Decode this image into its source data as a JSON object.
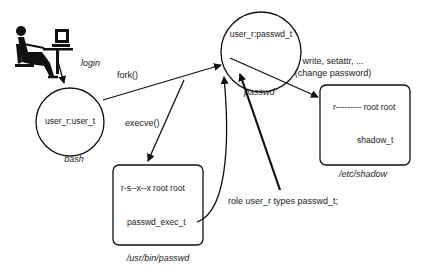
{
  "nodes": {
    "user": {
      "label": "login",
      "icon": "person-at-computer-icon"
    },
    "bash": {
      "label": "user_r:user_t",
      "caption": "bash"
    },
    "passwd_proc": {
      "label": "user_r:passwd_t",
      "caption": "passwd"
    },
    "passwd_file": {
      "perm": "r-s--x--x root root",
      "type": "passwd_exec_t",
      "caption": "/usr/bin/passwd"
    },
    "shadow_file": {
      "perm": "r--------- root root",
      "type": "shadow_t",
      "caption": "/etc/shadow"
    }
  },
  "edges": {
    "fork": "fork()",
    "execve": "execve()",
    "write_line1": "write, setattr, ...",
    "write_line2": "(change password)",
    "role": "role user_r types passwd_t;"
  }
}
